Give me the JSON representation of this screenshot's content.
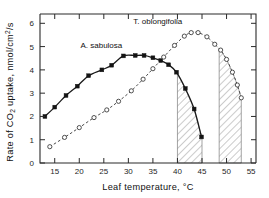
{
  "chart_data": {
    "type": "line",
    "title": "",
    "xlabel": "Leaf temperature, °C",
    "ylabel": "Rate of CO2 uptake, nmol/cm2/s",
    "ylabel_parts": {
      "pre": "Rate of CO",
      "sub1": "2",
      "mid": " uptake,  nmol/cm",
      "sup": "2",
      "post": "/s"
    },
    "xlim": [
      12,
      56
    ],
    "ylim": [
      0,
      6.4
    ],
    "xticks": [
      15,
      20,
      25,
      30,
      35,
      40,
      45,
      50,
      55
    ],
    "yticks": [
      0,
      1,
      2,
      3,
      4,
      5,
      6
    ],
    "grid": false,
    "legend_position": "inline-annotations",
    "series": [
      {
        "name": "A. sabulosa",
        "marker": "filled-square",
        "linestyle": "solid",
        "label_x": 24.5,
        "label_y": 4.95,
        "x": [
          13.0,
          15.0,
          17.3,
          19.6,
          21.9,
          24.6,
          26.6,
          29.0,
          31.4,
          33.2,
          35.0,
          36.6,
          38.2,
          39.8,
          41.6,
          43.4,
          44.9
        ],
        "y": [
          2.0,
          2.4,
          2.9,
          3.3,
          3.75,
          4.0,
          4.2,
          4.6,
          4.62,
          4.62,
          4.52,
          4.4,
          4.22,
          3.9,
          3.2,
          2.32,
          1.12
        ]
      },
      {
        "name": "T. oblongifolia",
        "marker": "open-circle",
        "linestyle": "dashed",
        "label_x": 36.0,
        "label_y": 5.95,
        "x": [
          14.0,
          17.0,
          20.0,
          23.0,
          25.6,
          28.0,
          30.6,
          33.0,
          35.0,
          37.2,
          39.4,
          41.4,
          42.8,
          44.2,
          46.0,
          47.6,
          48.8,
          50.0,
          51.2,
          52.2,
          53.0
        ],
        "y": [
          0.7,
          1.1,
          1.52,
          1.95,
          2.28,
          2.65,
          3.1,
          3.6,
          4.05,
          4.55,
          5.05,
          5.45,
          5.6,
          5.6,
          5.42,
          5.1,
          4.85,
          4.45,
          3.9,
          3.35,
          2.8
        ]
      }
    ],
    "shaded_bands": [
      {
        "label": "band-a-sabulosa",
        "x_start": 40.0,
        "x_end": 45.0,
        "hatch": "diagonal"
      },
      {
        "label": "band-t-oblongifolia",
        "x_start": 48.5,
        "x_end": 53.0,
        "hatch": "diagonal"
      }
    ]
  }
}
